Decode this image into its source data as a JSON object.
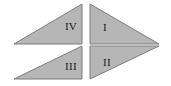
{
  "figure": {
    "name": "four-right-triangles-quadrant-diagram",
    "background_color": "#ffffff",
    "fill_color": "#b6b6b6",
    "stroke_color": "#7d7d7d",
    "label_color": "#1a1a1a",
    "canvas": {
      "width": 171,
      "height": 86
    },
    "triangles": [
      {
        "label": "I",
        "quadrant": "top-right",
        "points": "90,4 90,44 159,44",
        "right_angle_at": "top-left",
        "label_x": 105,
        "label_y": 28
      },
      {
        "label": "II",
        "quadrant": "bottom-right",
        "points": "90,79 90,46 159,46",
        "right_angle_at": "bottom-left",
        "label_x": 107,
        "label_y": 63
      },
      {
        "label": "III",
        "quadrant": "bottom-left",
        "points": "82,46 82,79 14,79",
        "right_angle_at": "top-right",
        "label_x": 71,
        "label_y": 67
      },
      {
        "label": "IV",
        "quadrant": "top-left",
        "points": "82,4 82,44 14,44",
        "right_angle_at": "bottom-right",
        "label_x": 71,
        "label_y": 27
      }
    ]
  }
}
